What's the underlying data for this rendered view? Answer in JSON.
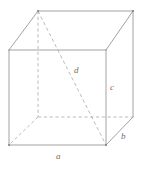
{
  "figure": {
    "kind": "rectangular-box-diagram",
    "stroke_color": "#8a8a8a",
    "hidden_stroke_color": "#a8a8a8",
    "background_color": "#ffffff",
    "label_color": "#6e6e6e"
  },
  "labels": {
    "length": "a",
    "depth": "b",
    "height": "c",
    "diagonal": "d"
  },
  "geometry": {
    "front_face": {
      "top_left": [
        9,
        50
      ],
      "top_right": [
        106,
        50
      ],
      "bottom_right": [
        106,
        145
      ],
      "bottom_left": [
        9,
        145
      ]
    },
    "back_face": {
      "top_left": [
        38,
        11
      ],
      "top_right": [
        133,
        11
      ],
      "bottom_right": [
        133,
        117
      ],
      "bottom_left": [
        38,
        117
      ]
    },
    "space_diagonal": {
      "from": [
        38,
        11
      ],
      "to": [
        106,
        145
      ],
      "style": "dashed"
    },
    "hidden_edges": [
      {
        "from": [
          38,
          117
        ],
        "to": [
          38,
          11
        ],
        "note": "back-left vertical"
      },
      {
        "from": [
          38,
          117
        ],
        "to": [
          133,
          117
        ],
        "note": "back-bottom horizontal"
      },
      {
        "from": [
          38,
          117
        ],
        "to": [
          9,
          145
        ],
        "note": "bottom-left receding"
      }
    ]
  }
}
